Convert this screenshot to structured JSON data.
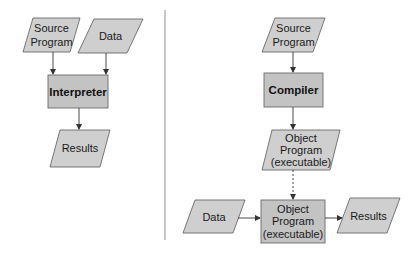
{
  "diagram": {
    "left_panel": {
      "title": "Interpretation",
      "nodes": {
        "source_program": {
          "lines": [
            "Source",
            "Program"
          ],
          "shape": "parallelogram"
        },
        "data": {
          "lines": [
            "Data"
          ],
          "shape": "parallelogram"
        },
        "interpreter": {
          "label": "Interpreter",
          "shape": "box",
          "bold": true
        },
        "results": {
          "lines": [
            "Results"
          ],
          "shape": "parallelogram"
        }
      },
      "edges": [
        {
          "from": "source_program",
          "to": "interpreter",
          "style": "solid"
        },
        {
          "from": "data",
          "to": "interpreter",
          "style": "solid"
        },
        {
          "from": "interpreter",
          "to": "results",
          "style": "solid"
        }
      ]
    },
    "right_panel": {
      "title": "Compilation",
      "nodes": {
        "source_program": {
          "lines": [
            "Source",
            "Program"
          ],
          "shape": "parallelogram"
        },
        "compiler": {
          "label": "Compiler",
          "shape": "box",
          "bold": true
        },
        "object_program": {
          "lines": [
            "Object",
            "Program",
            "(executable)"
          ],
          "shape": "parallelogram"
        },
        "data": {
          "lines": [
            "Data"
          ],
          "shape": "parallelogram"
        },
        "object_program_exec": {
          "lines": [
            "Object",
            "Program",
            "(executable)"
          ],
          "shape": "box"
        },
        "results": {
          "lines": [
            "Results"
          ],
          "shape": "parallelogram"
        }
      },
      "edges": [
        {
          "from": "source_program",
          "to": "compiler",
          "style": "solid"
        },
        {
          "from": "compiler",
          "to": "object_program",
          "style": "solid"
        },
        {
          "from": "object_program",
          "to": "object_program_exec",
          "style": "dashed"
        },
        {
          "from": "data",
          "to": "object_program_exec",
          "style": "solid"
        },
        {
          "from": "object_program_exec",
          "to": "results",
          "style": "solid"
        }
      ]
    },
    "colors": {
      "parallelogram_fill": "#cfcfcf",
      "box_fill": "#c3c3c3",
      "stroke": "#6a6a6a",
      "divider": "#b0b0b0"
    }
  }
}
